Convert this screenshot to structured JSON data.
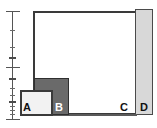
{
  "figure": {
    "width_px": 157,
    "height_px": 128,
    "background_color": "#ffffff"
  },
  "scale_axis": {
    "name": "logarithmic-scale-bar",
    "orientation": "vertical",
    "line_color": "#555555",
    "spine": {
      "x": 12,
      "top": 11,
      "height": 109
    },
    "caps": [
      {
        "name": "cap-top",
        "y": 11
      },
      {
        "name": "cap-middle",
        "y": 67
      },
      {
        "name": "cap-bottom",
        "y": 119
      }
    ],
    "ticks": [
      {
        "y": 30,
        "size": "small"
      },
      {
        "y": 47,
        "size": "small"
      },
      {
        "y": 57,
        "size": "big"
      },
      {
        "y": 78,
        "size": "big"
      },
      {
        "y": 88,
        "size": "small"
      },
      {
        "y": 95,
        "size": "small"
      },
      {
        "y": 101,
        "size": "big"
      },
      {
        "y": 106,
        "size": "small"
      },
      {
        "y": 110,
        "size": "small"
      },
      {
        "y": 114,
        "size": "small"
      }
    ]
  },
  "boxes": [
    {
      "id": "a",
      "label": "A",
      "fill": "#f2f2f2",
      "stroke": "#3a3a3a",
      "x": 20,
      "y": 90,
      "width": 33,
      "height": 26,
      "label_x": 23,
      "label_y": 102
    },
    {
      "id": "b",
      "label": "B",
      "fill": "#6a6a6a",
      "stroke": "#2f2f2f",
      "x": 34,
      "y": 78,
      "width": 35,
      "height": 37,
      "label_x": 55,
      "label_y": 102
    },
    {
      "id": "c",
      "label": "C",
      "fill": "#ffffff",
      "stroke": "#3a3a3a",
      "x": 33,
      "y": 11,
      "width": 104,
      "height": 104,
      "label_x": 120,
      "label_y": 102
    },
    {
      "id": "d",
      "label": "D",
      "fill": "#d8d8d8",
      "stroke": "#4a4a4a",
      "x": 135,
      "y": 9,
      "width": 18,
      "height": 106,
      "label_x": 140,
      "label_y": 102
    }
  ],
  "baseline": {
    "name": "ground-baseline",
    "x": 33,
    "y": 114,
    "width": 104,
    "height": 2,
    "color": "#5a5a5a"
  }
}
